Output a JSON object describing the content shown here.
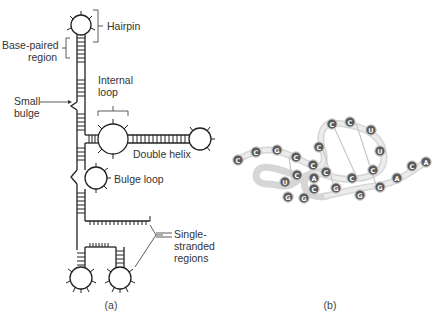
{
  "panel_a": {
    "caption": "(a)",
    "labels": {
      "hairpin": "Hairpin",
      "base_paired_1": "Base-paired",
      "base_paired_2": "region",
      "internal_loop_1": "Internal",
      "internal_loop_2": "loop",
      "small_bulge_1": "Small",
      "small_bulge_2": "bulge",
      "double_helix": "Double helix",
      "bulge_loop": "Bulge loop",
      "single_stranded_1": "Single-",
      "single_stranded_2": "stranded",
      "single_stranded_3": "regions"
    }
  },
  "panel_b": {
    "caption": "(b)",
    "nucleotides": [
      {
        "id": "n1",
        "base": "C"
      },
      {
        "id": "n2",
        "base": "C"
      },
      {
        "id": "n3",
        "base": "G"
      },
      {
        "id": "n4",
        "base": "C"
      },
      {
        "id": "n5",
        "base": "C"
      },
      {
        "id": "n6",
        "base": "C"
      },
      {
        "id": "n7",
        "base": "C"
      },
      {
        "id": "n8",
        "base": "C"
      },
      {
        "id": "n9",
        "base": "U"
      },
      {
        "id": "n10",
        "base": "U"
      },
      {
        "id": "n11",
        "base": "C"
      },
      {
        "id": "n12",
        "base": "C"
      },
      {
        "id": "n13",
        "base": "C"
      },
      {
        "id": "n14",
        "base": "A"
      },
      {
        "id": "n15",
        "base": "C"
      },
      {
        "id": "n16",
        "base": "G"
      },
      {
        "id": "n17",
        "base": "G"
      },
      {
        "id": "n18",
        "base": "U"
      },
      {
        "id": "n19",
        "base": "C"
      },
      {
        "id": "n20",
        "base": "G"
      },
      {
        "id": "n21",
        "base": "G"
      },
      {
        "id": "n22",
        "base": "G"
      },
      {
        "id": "n23",
        "base": "A"
      },
      {
        "id": "n24",
        "base": "C"
      },
      {
        "id": "n25",
        "base": "A"
      }
    ]
  }
}
